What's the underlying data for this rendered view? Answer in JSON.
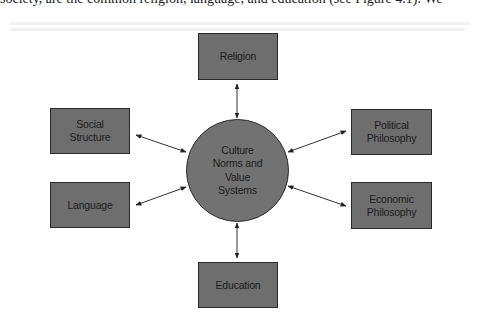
{
  "page": {
    "top_text": "society, are the common religion, language, and education (see Figure 4.1). We"
  },
  "diagram": {
    "center": {
      "label": "Culture\nNorms and\nValue\nSystems"
    },
    "nodes": [
      {
        "id": "religion",
        "label": "Religion"
      },
      {
        "id": "social-structure",
        "label": "Social\nStructure"
      },
      {
        "id": "language",
        "label": "Language"
      },
      {
        "id": "political-philosophy",
        "label": "Political\nPhilosophy"
      },
      {
        "id": "economic-philosophy",
        "label": "Economic\nPhilosophy"
      },
      {
        "id": "education",
        "label": "Education"
      }
    ],
    "edges": [
      {
        "from": "religion",
        "to": "center",
        "type": "bidirectional"
      },
      {
        "from": "social-structure",
        "to": "center",
        "type": "bidirectional"
      },
      {
        "from": "language",
        "to": "center",
        "type": "bidirectional"
      },
      {
        "from": "political-philosophy",
        "to": "center",
        "type": "bidirectional"
      },
      {
        "from": "economic-philosophy",
        "to": "center",
        "type": "bidirectional"
      },
      {
        "from": "education",
        "to": "center",
        "type": "bidirectional"
      }
    ],
    "colors": {
      "box_fill": "#6e6e6e",
      "border": "#2a2a2a",
      "arrow": "#333333",
      "background": "#ffffff"
    }
  }
}
